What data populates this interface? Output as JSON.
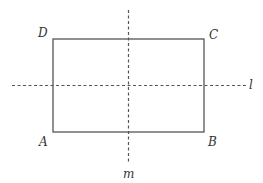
{
  "diagram": {
    "type": "rectangle with axes of symmetry",
    "rectangle": {
      "vertices": [
        {
          "label": "A",
          "position": "bottom-left"
        },
        {
          "label": "B",
          "position": "bottom-right"
        },
        {
          "label": "C",
          "position": "top-right"
        },
        {
          "label": "D",
          "position": "top-left"
        }
      ]
    },
    "lines": [
      {
        "label": "l",
        "orientation": "horizontal",
        "style": "dashed"
      },
      {
        "label": "m",
        "orientation": "vertical",
        "style": "dashed"
      }
    ],
    "colors": {
      "stroke": "#555555",
      "text": "#333333",
      "background": "#ffffff"
    }
  }
}
